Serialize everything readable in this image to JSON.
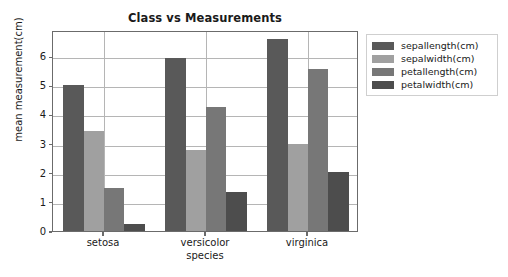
{
  "chart_data": {
    "type": "bar",
    "title": "Class vs Measurements",
    "xlabel": "species",
    "ylabel": "mean measurement(cm)",
    "categories": [
      "setosa",
      "versicolor",
      "virginica"
    ],
    "series": [
      {
        "name": "sepallength(cm)",
        "color": "#595959",
        "values": [
          5.01,
          5.94,
          6.59
        ]
      },
      {
        "name": "sepalwidth(cm)",
        "color": "#a0a0a0",
        "values": [
          3.42,
          2.77,
          2.97
        ]
      },
      {
        "name": "petallength(cm)",
        "color": "#777777",
        "values": [
          1.46,
          4.26,
          5.55
        ]
      },
      {
        "name": "petalwidth(cm)",
        "color": "#4d4d4d",
        "values": [
          0.25,
          1.33,
          2.03
        ]
      }
    ],
    "ylim": [
      0,
      6.9
    ],
    "yticks": [
      0,
      1,
      2,
      3,
      4,
      5,
      6
    ],
    "ytick_labels": [
      "0",
      "1",
      "2",
      "3",
      "4",
      "5",
      "6"
    ],
    "grid": true,
    "grid_axis": "both",
    "legend_position": "upper right outside",
    "bar_width_units": 0.2,
    "group_spacing": 1.0
  },
  "figure": {
    "background": "#ffffff",
    "axes_edge_color": "#6b6b6b",
    "grid_color": "#b5b5b5",
    "text_color": "#1a1a1a"
  }
}
